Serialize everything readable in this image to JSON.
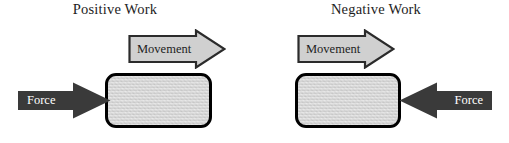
{
  "diagram": {
    "background_color": "#ffffff",
    "panels": [
      {
        "id": "positive",
        "title": "Positive Work",
        "movement_label": "Movement",
        "movement_direction": "right",
        "force_label": "Force",
        "force_direction": "right",
        "block_fill": "#d6d6d6",
        "block_border": "#000000",
        "force_arrow_fill": "#3a3a3a",
        "force_label_color": "#ffffff",
        "movement_arrow_fill": "#d0d0d0",
        "movement_arrow_stroke": "#2b2b2b",
        "movement_label_color": "#1d1d1d"
      },
      {
        "id": "negative",
        "title": "Negative Work",
        "movement_label": "Movement",
        "movement_direction": "right",
        "force_label": "Force",
        "force_direction": "left",
        "block_fill": "#d6d6d6",
        "block_border": "#000000",
        "force_arrow_fill": "#3a3a3a",
        "force_label_color": "#ffffff",
        "movement_arrow_fill": "#d0d0d0",
        "movement_arrow_stroke": "#2b2b2b",
        "movement_label_color": "#1d1d1d"
      }
    ]
  }
}
